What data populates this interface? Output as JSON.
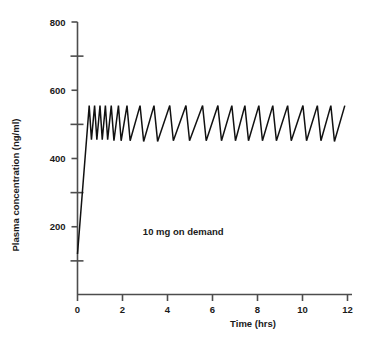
{
  "chart_data": {
    "type": "line",
    "title": "",
    "xlabel": "Time (hrs)",
    "ylabel": "Plasma concentration (ng/ml)",
    "xlim": [
      0,
      12
    ],
    "ylim": [
      0,
      800
    ],
    "xticks": [
      0,
      2,
      4,
      6,
      8,
      10,
      12
    ],
    "xtick_labels": [
      "0",
      "2",
      "4",
      "6",
      "8",
      "10",
      "12"
    ],
    "yticks": [
      200,
      400,
      600,
      800
    ],
    "ytick_labels": [
      "200",
      "400",
      "600",
      "800"
    ],
    "yminor_ticks": [
      100,
      300,
      500,
      700
    ],
    "grid": false,
    "legend": null,
    "annotations": [
      {
        "text": "10 mg on demand",
        "x": 4.7,
        "y": 175
      }
    ],
    "series": [
      {
        "name": "plasma concentration",
        "color": "#111111",
        "x": [
          0.0,
          0.52,
          0.62,
          0.76,
          0.86,
          1.0,
          1.1,
          1.24,
          1.34,
          1.5,
          1.62,
          1.82,
          1.94,
          2.2,
          2.34,
          2.78,
          2.94,
          3.4,
          3.56,
          4.1,
          4.26,
          4.82,
          4.98,
          5.56,
          5.72,
          6.24,
          6.4,
          6.86,
          7.02,
          7.44,
          7.6,
          8.06,
          8.22,
          8.68,
          8.84,
          9.34,
          9.5,
          10.02,
          10.18,
          10.66,
          10.82,
          11.26,
          11.42,
          11.88
        ],
        "y": [
          120,
          555,
          455,
          555,
          455,
          555,
          455,
          555,
          455,
          555,
          452,
          555,
          452,
          555,
          452,
          555,
          450,
          555,
          450,
          555,
          452,
          555,
          452,
          555,
          452,
          555,
          452,
          555,
          452,
          555,
          452,
          555,
          452,
          555,
          452,
          555,
          452,
          555,
          452,
          555,
          452,
          555,
          450,
          555
        ]
      }
    ]
  },
  "axes": {
    "y_title": "Plasma concentration (ng/ml)",
    "x_title": "Time (hrs)"
  },
  "annotation": {
    "dose_note": "10 mg on demand"
  },
  "colors": {
    "line": "#111111",
    "axis": "#4d4d4d",
    "text": "#1a1a1a",
    "background": "#ffffff"
  }
}
